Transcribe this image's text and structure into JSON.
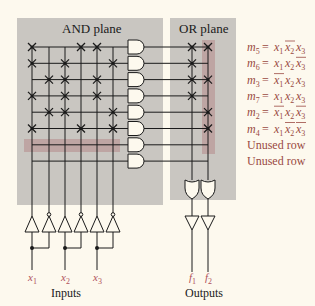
{
  "planes": {
    "and_title": "AND plane",
    "or_title": "OR plane"
  },
  "colors": {
    "background": "#fdf9ee",
    "plane_fill": "#c9c6c1",
    "highlight": "#b99a98",
    "label_red": "#9a4a42",
    "wire": "#1a1a1a"
  },
  "inputs": {
    "caption": "Inputs",
    "labels": [
      {
        "var": "x",
        "sub": "1"
      },
      {
        "var": "x",
        "sub": "2"
      },
      {
        "var": "x",
        "sub": "3"
      }
    ]
  },
  "outputs": {
    "caption": "Outputs",
    "labels": [
      {
        "var": "f",
        "sub": "1"
      },
      {
        "var": "f",
        "sub": "2"
      }
    ]
  },
  "rows": [
    {
      "name": "m",
      "sub": "5",
      "terms": [
        {
          "v": "x",
          "s": "1",
          "bar": false
        },
        {
          "v": "x",
          "s": "2",
          "bar": true
        },
        {
          "v": "x",
          "s": "3",
          "bar": false
        }
      ],
      "and_cols": [
        0,
        3,
        4
      ],
      "or": [
        true,
        true
      ]
    },
    {
      "name": "m",
      "sub": "6",
      "terms": [
        {
          "v": "x",
          "s": "1",
          "bar": false
        },
        {
          "v": "x",
          "s": "2",
          "bar": false
        },
        {
          "v": "x",
          "s": "3",
          "bar": true
        }
      ],
      "and_cols": [
        0,
        2,
        5
      ],
      "or": [
        true,
        false
      ]
    },
    {
      "name": "m",
      "sub": "3",
      "terms": [
        {
          "v": "x",
          "s": "1",
          "bar": true
        },
        {
          "v": "x",
          "s": "2",
          "bar": false
        },
        {
          "v": "x",
          "s": "3",
          "bar": false
        }
      ],
      "and_cols": [
        1,
        2,
        4
      ],
      "or": [
        true,
        true
      ]
    },
    {
      "name": "m",
      "sub": "7",
      "terms": [
        {
          "v": "x",
          "s": "1",
          "bar": false
        },
        {
          "v": "x",
          "s": "2",
          "bar": false
        },
        {
          "v": "x",
          "s": "3",
          "bar": false
        }
      ],
      "and_cols": [
        0,
        2,
        4
      ],
      "or": [
        true,
        false
      ]
    },
    {
      "name": "m",
      "sub": "2",
      "terms": [
        {
          "v": "x",
          "s": "1",
          "bar": true
        },
        {
          "v": "x",
          "s": "2",
          "bar": false
        },
        {
          "v": "x",
          "s": "3",
          "bar": true
        }
      ],
      "and_cols": [
        1,
        2,
        5
      ],
      "or": [
        false,
        true
      ]
    },
    {
      "name": "m",
      "sub": "4",
      "terms": [
        {
          "v": "x",
          "s": "1",
          "bar": false
        },
        {
          "v": "x",
          "s": "2",
          "bar": true
        },
        {
          "v": "x",
          "s": "3",
          "bar": true
        }
      ],
      "and_cols": [
        0,
        3,
        5
      ],
      "or": [
        false,
        true
      ]
    }
  ],
  "unused_rows": [
    "Unused row",
    "Unused row"
  ]
}
